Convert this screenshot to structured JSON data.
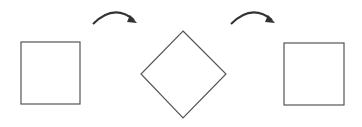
{
  "diagram": {
    "stroke_color": "#555555",
    "arrow_color": "#333333",
    "shapes": [
      {
        "name": "square-initial",
        "type": "square",
        "x": 21,
        "y": 42,
        "w": 59,
        "h": 62
      },
      {
        "name": "square-rotated",
        "type": "diamond",
        "points": "183,31 226,74 183,118 141,74"
      },
      {
        "name": "square-final",
        "type": "square",
        "x": 284,
        "y": 43,
        "w": 60,
        "h": 62
      }
    ],
    "arrows": [
      {
        "name": "rotate-arrow-1",
        "path": "M93,24 Q114,3 134,20",
        "head": "130,15 137,23 127,22"
      },
      {
        "name": "rotate-arrow-2",
        "path": "M231,24 Q252,3 272,20",
        "head": "268,15 275,23 265,22"
      }
    ]
  }
}
